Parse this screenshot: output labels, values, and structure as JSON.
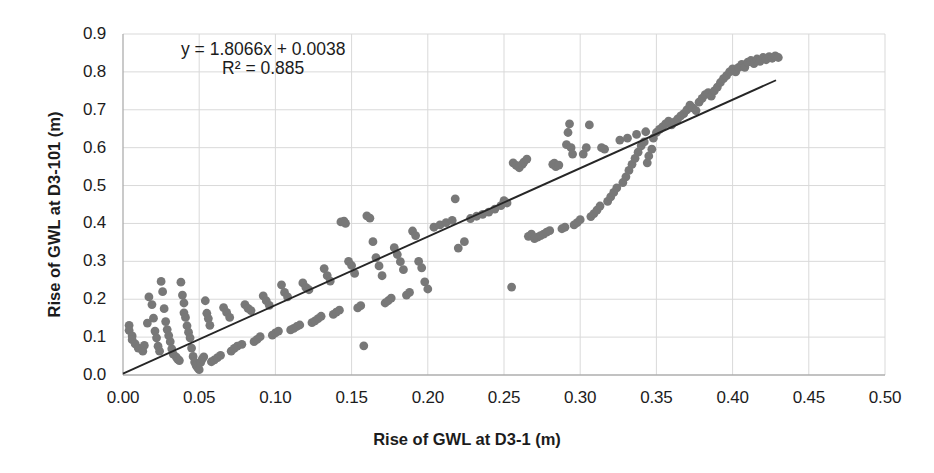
{
  "chart_data": {
    "type": "scatter",
    "title": "",
    "xlabel": "Rise of GWL at D3-1 (m)",
    "ylabel": "Rise of GWL at D3-101 (m)",
    "xlim": [
      0.0,
      0.5
    ],
    "ylim": [
      0.0,
      0.9
    ],
    "xticks": [
      "0.00",
      "0.05",
      "0.10",
      "0.15",
      "0.20",
      "0.25",
      "0.30",
      "0.35",
      "0.40",
      "0.45",
      "0.50"
    ],
    "xtick_values": [
      0.0,
      0.05,
      0.1,
      0.15,
      0.2,
      0.25,
      0.3,
      0.35,
      0.4,
      0.45,
      0.5
    ],
    "yticks": [
      "0.0",
      "0.1",
      "0.2",
      "0.3",
      "0.4",
      "0.5",
      "0.6",
      "0.7",
      "0.8",
      "0.9"
    ],
    "ytick_values": [
      0.0,
      0.1,
      0.2,
      0.3,
      0.4,
      0.5,
      0.6,
      0.7,
      0.8,
      0.9
    ],
    "grid": true,
    "grid_color": "#d9d9d9",
    "axis_color": "#aeaeae",
    "legend": false,
    "marker_color": "#787878",
    "marker_radius": 4.4,
    "trendline": {
      "equation_label": "y = 1.8066x + 0.0038",
      "r2_label": "R² = 0.885",
      "slope": 1.8066,
      "intercept": 0.0038,
      "r2": 0.885,
      "color": "#262626",
      "width": 1.9,
      "x_start": 0.0,
      "x_end": 0.4285
    },
    "annotations": [
      {
        "text": "y = 1.8066x + 0.0038",
        "x": 0.092,
        "y": 0.855
      },
      {
        "text": "R² = 0.885",
        "x": 0.092,
        "y": 0.805
      }
    ],
    "series": [
      {
        "name": "GWL rise pairs",
        "points": [
          [
            0.004,
            0.131
          ],
          [
            0.004,
            0.118
          ],
          [
            0.006,
            0.103
          ],
          [
            0.006,
            0.093
          ],
          [
            0.008,
            0.082
          ],
          [
            0.01,
            0.071
          ],
          [
            0.013,
            0.063
          ],
          [
            0.014,
            0.078
          ],
          [
            0.016,
            0.137
          ],
          [
            0.017,
            0.206
          ],
          [
            0.019,
            0.186
          ],
          [
            0.02,
            0.15
          ],
          [
            0.021,
            0.116
          ],
          [
            0.022,
            0.098
          ],
          [
            0.023,
            0.076
          ],
          [
            0.024,
            0.063
          ],
          [
            0.025,
            0.247
          ],
          [
            0.026,
            0.22
          ],
          [
            0.027,
            0.175
          ],
          [
            0.028,
            0.141
          ],
          [
            0.029,
            0.12
          ],
          [
            0.03,
            0.104
          ],
          [
            0.031,
            0.088
          ],
          [
            0.032,
            0.069
          ],
          [
            0.033,
            0.055
          ],
          [
            0.035,
            0.047
          ],
          [
            0.036,
            0.041
          ],
          [
            0.037,
            0.038
          ],
          [
            0.038,
            0.245
          ],
          [
            0.039,
            0.211
          ],
          [
            0.04,
            0.19
          ],
          [
            0.04,
            0.164
          ],
          [
            0.041,
            0.152
          ],
          [
            0.042,
            0.13
          ],
          [
            0.043,
            0.113
          ],
          [
            0.044,
            0.098
          ],
          [
            0.045,
            0.071
          ],
          [
            0.046,
            0.049
          ],
          [
            0.047,
            0.034
          ],
          [
            0.048,
            0.025
          ],
          [
            0.049,
            0.019
          ],
          [
            0.05,
            0.014
          ],
          [
            0.051,
            0.033
          ],
          [
            0.052,
            0.042
          ],
          [
            0.053,
            0.048
          ],
          [
            0.054,
            0.196
          ],
          [
            0.055,
            0.163
          ],
          [
            0.056,
            0.149
          ],
          [
            0.057,
            0.131
          ],
          [
            0.058,
            0.035
          ],
          [
            0.06,
            0.04
          ],
          [
            0.062,
            0.046
          ],
          [
            0.064,
            0.052
          ],
          [
            0.066,
            0.178
          ],
          [
            0.068,
            0.165
          ],
          [
            0.07,
            0.152
          ],
          [
            0.071,
            0.063
          ],
          [
            0.073,
            0.07
          ],
          [
            0.075,
            0.076
          ],
          [
            0.078,
            0.081
          ],
          [
            0.08,
            0.186
          ],
          [
            0.082,
            0.176
          ],
          [
            0.084,
            0.17
          ],
          [
            0.086,
            0.088
          ],
          [
            0.088,
            0.094
          ],
          [
            0.09,
            0.101
          ],
          [
            0.092,
            0.209
          ],
          [
            0.094,
            0.196
          ],
          [
            0.096,
            0.184
          ],
          [
            0.098,
            0.105
          ],
          [
            0.1,
            0.111
          ],
          [
            0.102,
            0.116
          ],
          [
            0.104,
            0.238
          ],
          [
            0.106,
            0.218
          ],
          [
            0.108,
            0.206
          ],
          [
            0.11,
            0.119
          ],
          [
            0.112,
            0.123
          ],
          [
            0.114,
            0.128
          ],
          [
            0.116,
            0.132
          ],
          [
            0.118,
            0.243
          ],
          [
            0.12,
            0.231
          ],
          [
            0.122,
            0.225
          ],
          [
            0.124,
            0.138
          ],
          [
            0.126,
            0.143
          ],
          [
            0.128,
            0.149
          ],
          [
            0.13,
            0.155
          ],
          [
            0.132,
            0.281
          ],
          [
            0.134,
            0.262
          ],
          [
            0.136,
            0.248
          ],
          [
            0.138,
            0.16
          ],
          [
            0.14,
            0.166
          ],
          [
            0.142,
            0.171
          ],
          [
            0.143,
            0.404
          ],
          [
            0.145,
            0.406
          ],
          [
            0.146,
            0.4
          ],
          [
            0.148,
            0.3
          ],
          [
            0.15,
            0.289
          ],
          [
            0.152,
            0.268
          ],
          [
            0.154,
            0.177
          ],
          [
            0.156,
            0.183
          ],
          [
            0.158,
            0.077
          ],
          [
            0.16,
            0.42
          ],
          [
            0.162,
            0.414
          ],
          [
            0.164,
            0.352
          ],
          [
            0.166,
            0.31
          ],
          [
            0.168,
            0.288
          ],
          [
            0.17,
            0.262
          ],
          [
            0.172,
            0.19
          ],
          [
            0.174,
            0.196
          ],
          [
            0.176,
            0.203
          ],
          [
            0.178,
            0.336
          ],
          [
            0.18,
            0.318
          ],
          [
            0.182,
            0.299
          ],
          [
            0.184,
            0.278
          ],
          [
            0.186,
            0.211
          ],
          [
            0.188,
            0.218
          ],
          [
            0.19,
            0.38
          ],
          [
            0.192,
            0.368
          ],
          [
            0.194,
            0.3
          ],
          [
            0.196,
            0.283
          ],
          [
            0.198,
            0.246
          ],
          [
            0.2,
            0.227
          ],
          [
            0.204,
            0.39
          ],
          [
            0.208,
            0.396
          ],
          [
            0.212,
            0.402
          ],
          [
            0.216,
            0.408
          ],
          [
            0.218,
            0.465
          ],
          [
            0.22,
            0.335
          ],
          [
            0.224,
            0.352
          ],
          [
            0.228,
            0.413
          ],
          [
            0.232,
            0.419
          ],
          [
            0.236,
            0.424
          ],
          [
            0.24,
            0.43
          ],
          [
            0.244,
            0.438
          ],
          [
            0.248,
            0.447
          ],
          [
            0.25,
            0.46
          ],
          [
            0.252,
            0.454
          ],
          [
            0.255,
            0.232
          ],
          [
            0.256,
            0.56
          ],
          [
            0.258,
            0.553
          ],
          [
            0.26,
            0.547
          ],
          [
            0.262,
            0.556
          ],
          [
            0.263,
            0.562
          ],
          [
            0.265,
            0.57
          ],
          [
            0.266,
            0.366
          ],
          [
            0.268,
            0.372
          ],
          [
            0.27,
            0.36
          ],
          [
            0.272,
            0.364
          ],
          [
            0.274,
            0.368
          ],
          [
            0.276,
            0.372
          ],
          [
            0.278,
            0.377
          ],
          [
            0.28,
            0.381
          ],
          [
            0.282,
            0.556
          ],
          [
            0.283,
            0.559
          ],
          [
            0.284,
            0.55
          ],
          [
            0.286,
            0.554
          ],
          [
            0.288,
            0.386
          ],
          [
            0.29,
            0.39
          ],
          [
            0.291,
            0.608
          ],
          [
            0.292,
            0.64
          ],
          [
            0.293,
            0.663
          ],
          [
            0.294,
            0.6
          ],
          [
            0.295,
            0.583
          ],
          [
            0.296,
            0.396
          ],
          [
            0.298,
            0.402
          ],
          [
            0.3,
            0.41
          ],
          [
            0.302,
            0.583
          ],
          [
            0.304,
            0.6
          ],
          [
            0.306,
            0.66
          ],
          [
            0.307,
            0.418
          ],
          [
            0.309,
            0.426
          ],
          [
            0.311,
            0.435
          ],
          [
            0.313,
            0.446
          ],
          [
            0.314,
            0.6
          ],
          [
            0.316,
            0.596
          ],
          [
            0.318,
            0.458
          ],
          [
            0.32,
            0.47
          ],
          [
            0.322,
            0.482
          ],
          [
            0.324,
            0.494
          ],
          [
            0.326,
            0.62
          ],
          [
            0.328,
            0.508
          ],
          [
            0.33,
            0.523
          ],
          [
            0.331,
            0.625
          ],
          [
            0.332,
            0.54
          ],
          [
            0.334,
            0.556
          ],
          [
            0.336,
            0.572
          ],
          [
            0.337,
            0.635
          ],
          [
            0.338,
            0.588
          ],
          [
            0.34,
            0.605
          ],
          [
            0.342,
            0.615
          ],
          [
            0.343,
            0.642
          ],
          [
            0.344,
            0.56
          ],
          [
            0.345,
            0.578
          ],
          [
            0.347,
            0.596
          ],
          [
            0.348,
            0.625
          ],
          [
            0.35,
            0.64
          ],
          [
            0.352,
            0.648
          ],
          [
            0.354,
            0.655
          ],
          [
            0.356,
            0.663
          ],
          [
            0.358,
            0.67
          ],
          [
            0.36,
            0.66
          ],
          [
            0.362,
            0.668
          ],
          [
            0.364,
            0.676
          ],
          [
            0.366,
            0.684
          ],
          [
            0.368,
            0.69
          ],
          [
            0.37,
            0.7
          ],
          [
            0.372,
            0.712
          ],
          [
            0.374,
            0.705
          ],
          [
            0.376,
            0.698
          ],
          [
            0.378,
            0.72
          ],
          [
            0.38,
            0.73
          ],
          [
            0.382,
            0.74
          ],
          [
            0.384,
            0.745
          ],
          [
            0.386,
            0.736
          ],
          [
            0.388,
            0.75
          ],
          [
            0.39,
            0.76
          ],
          [
            0.392,
            0.772
          ],
          [
            0.394,
            0.782
          ],
          [
            0.396,
            0.79
          ],
          [
            0.398,
            0.8
          ],
          [
            0.4,
            0.808
          ],
          [
            0.402,
            0.8
          ],
          [
            0.404,
            0.812
          ],
          [
            0.406,
            0.82
          ],
          [
            0.408,
            0.812
          ],
          [
            0.41,
            0.826
          ],
          [
            0.412,
            0.83
          ],
          [
            0.414,
            0.822
          ],
          [
            0.416,
            0.834
          ],
          [
            0.418,
            0.828
          ],
          [
            0.42,
            0.838
          ],
          [
            0.422,
            0.832
          ],
          [
            0.424,
            0.84
          ],
          [
            0.426,
            0.836
          ],
          [
            0.428,
            0.842
          ],
          [
            0.43,
            0.838
          ]
        ]
      }
    ]
  }
}
